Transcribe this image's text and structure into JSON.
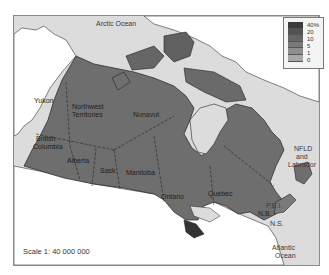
{
  "map": {
    "title": "",
    "scale_label": "Scale 1: 40 000 000",
    "labels": {
      "arctic_ocean": "Arctic Ocean",
      "atlantic_ocean_1": "Atlantic",
      "atlantic_ocean_2": "Ocean",
      "yukon": "Yukon",
      "nwt_1": "Northwest",
      "nwt_2": "Territories",
      "nunavut": "Nunavut",
      "bc_1": "British",
      "bc_2": "Columbia",
      "alberta": "Alberta",
      "sask": "Sask.",
      "manitoba": "Manitoba",
      "ontario": "Ontario",
      "quebec": "Quebec",
      "nfld_1": "NFLD",
      "nfld_2": "and",
      "nfld_3": "Labrador",
      "pei": "P.E.I.",
      "nb": "N.B.",
      "ns": "N.S."
    },
    "legend": {
      "items": [
        {
          "label": "40%",
          "color": "#3c3c3c"
        },
        {
          "label": "20",
          "color": "#525252"
        },
        {
          "label": "10",
          "color": "#666666"
        },
        {
          "label": "5",
          "color": "#7a7a7a"
        },
        {
          "label": "1",
          "color": "#8e8e8e"
        },
        {
          "label": "0",
          "color": "#a8a8a8"
        }
      ]
    },
    "colors": {
      "water": "#dcdcdc",
      "land_foreign": "#ffffff",
      "land_canada": "#6e6e6e",
      "frame": "#8a8a8a"
    }
  }
}
